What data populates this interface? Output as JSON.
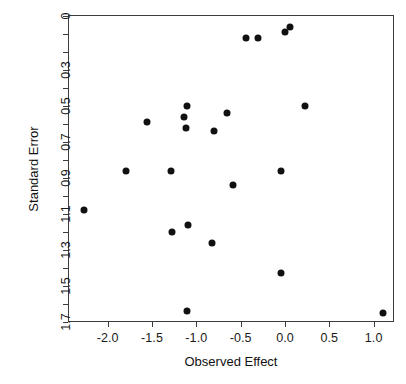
{
  "chart_data": {
    "type": "scatter",
    "title": "",
    "xlabel": "Observed Effect",
    "ylabel": "Standard Error",
    "xlim": [
      -2.44,
      1.23
    ],
    "ylim": [
      1.7,
      -0.02
    ],
    "y_axis_reversed": true,
    "grid": false,
    "legend": null,
    "xticks": [
      -2.0,
      -1.5,
      -1.0,
      -0.5,
      0.0,
      0.5,
      1.0
    ],
    "xticklabels": [
      "-2.0",
      "-1.5",
      "-1.0",
      "-0.5",
      "0.0",
      "0.5",
      "1.0"
    ],
    "yticks": [
      0,
      0.3,
      0.5,
      0.7,
      0.9,
      1.1,
      1.3,
      1.5,
      1.7
    ],
    "yticklabels": [
      "0",
      "0.3",
      "0.5",
      "0.7",
      "0.9",
      "1.1",
      "1.3",
      "1.5",
      "1.7"
    ],
    "y_minor_ticks": [
      0.1,
      0.2,
      0.4,
      0.6,
      0.8,
      1.0,
      1.2,
      1.4,
      1.6
    ],
    "marker": "filled-circle",
    "marker_color": "#111111",
    "marker_size_px": 7,
    "n_points": 22,
    "points": [
      {
        "x": 0.06,
        "y": 0.06
      },
      {
        "x": 0.0,
        "y": 0.09
      },
      {
        "x": -0.44,
        "y": 0.12
      },
      {
        "x": -0.3,
        "y": 0.12
      },
      {
        "x": -1.1,
        "y": 0.5
      },
      {
        "x": 0.22,
        "y": 0.5
      },
      {
        "x": -0.65,
        "y": 0.54
      },
      {
        "x": -1.14,
        "y": 0.56
      },
      {
        "x": -1.56,
        "y": 0.59
      },
      {
        "x": -1.12,
        "y": 0.62
      },
      {
        "x": -0.8,
        "y": 0.64
      },
      {
        "x": -1.79,
        "y": 0.86
      },
      {
        "x": -1.29,
        "y": 0.86
      },
      {
        "x": -0.04,
        "y": 0.86
      },
      {
        "x": -0.59,
        "y": 0.94
      },
      {
        "x": -2.27,
        "y": 1.08
      },
      {
        "x": -1.09,
        "y": 1.16
      },
      {
        "x": -1.27,
        "y": 1.2
      },
      {
        "x": -0.82,
        "y": 1.26
      },
      {
        "x": -0.05,
        "y": 1.43
      },
      {
        "x": -1.1,
        "y": 1.64
      },
      {
        "x": 1.1,
        "y": 1.65
      }
    ]
  },
  "axes": {
    "x_title": "Observed Effect",
    "y_title": "Standard Error"
  },
  "colors": {
    "marker": "#111111",
    "frame": "#3c3c3c",
    "background": "#ffffff",
    "text": "#1a1a1a"
  }
}
